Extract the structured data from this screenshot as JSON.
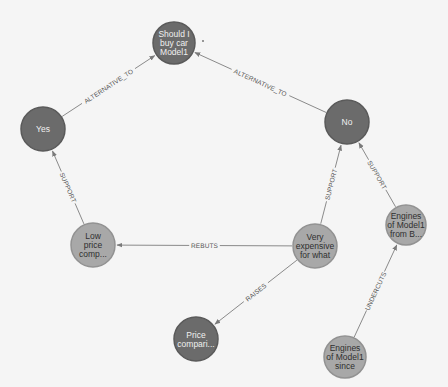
{
  "graph": {
    "nodes": [
      {
        "id": "question",
        "label_lines": [
          "Should I",
          "buy car",
          "Model1"
        ],
        "style": "dark",
        "cx": 174,
        "cy": 43,
        "r": 21
      },
      {
        "id": "yes",
        "label_lines": [
          "Yes"
        ],
        "style": "dark",
        "cx": 43,
        "cy": 129,
        "r": 22
      },
      {
        "id": "no",
        "label_lines": [
          "No"
        ],
        "style": "dark",
        "cx": 347,
        "cy": 122,
        "r": 22
      },
      {
        "id": "low-price",
        "label_lines": [
          "Low",
          "price",
          "comp..."
        ],
        "style": "light",
        "cx": 93,
        "cy": 245,
        "r": 22
      },
      {
        "id": "very-expensive",
        "label_lines": [
          "Very",
          "expensive",
          "for what"
        ],
        "style": "light",
        "cx": 315,
        "cy": 246,
        "r": 22
      },
      {
        "id": "engines-from",
        "label_lines": [
          "Engines",
          "of Model1",
          "from B..."
        ],
        "style": "light",
        "cx": 406,
        "cy": 225,
        "r": 20
      },
      {
        "id": "price-compari",
        "label_lines": [
          "Price",
          "compari..."
        ],
        "style": "dark",
        "cx": 196,
        "cy": 339,
        "r": 22
      },
      {
        "id": "engines-since",
        "label_lines": [
          "Engines",
          "of Model1",
          "since"
        ],
        "style": "light",
        "cx": 345,
        "cy": 357,
        "r": 21
      }
    ],
    "edges": [
      {
        "from": "yes",
        "to": "question",
        "label": "ALTERNATIVE_TO"
      },
      {
        "from": "no",
        "to": "question",
        "label": "ALTERNATIVE_TO"
      },
      {
        "from": "low-price",
        "to": "yes",
        "label": "SUPPORT"
      },
      {
        "from": "very-expensive",
        "to": "no",
        "label": "SUPPORT"
      },
      {
        "from": "engines-from",
        "to": "no",
        "label": "SUPPORT"
      },
      {
        "from": "very-expensive",
        "to": "low-price",
        "label": "REBUTS"
      },
      {
        "from": "very-expensive",
        "to": "price-compari",
        "label": "RAISES"
      },
      {
        "from": "engines-since",
        "to": "engines-from",
        "label": "UNDERCUTS"
      }
    ]
  },
  "colors": {
    "background": "#f5f5f5",
    "dark_node": "#6b6b6b",
    "light_node": "#a8a8a8",
    "edge": "#8a8a8a",
    "edge_label": "#555555"
  }
}
